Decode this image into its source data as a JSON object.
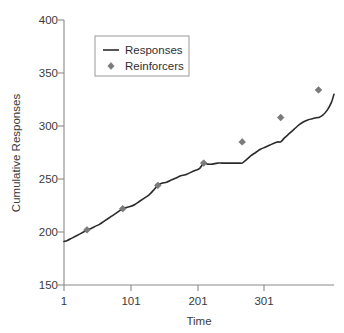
{
  "chart_data": {
    "type": "line",
    "title": "",
    "xlabel": "Time",
    "ylabel": "Cumulative Responses",
    "xlim": [
      1,
      401
    ],
    "ylim": [
      150,
      400
    ],
    "xticks": [
      "1",
      "101",
      "201",
      "301"
    ],
    "xtick_values": [
      1,
      101,
      201,
      301
    ],
    "yticks": [
      "150",
      "200",
      "250",
      "300",
      "350",
      "400"
    ],
    "ytick_values": [
      150,
      200,
      250,
      300,
      350,
      400
    ],
    "grid": false,
    "legend_position": "top-left-inside",
    "legend": [
      {
        "name": "Responses",
        "marker": "line",
        "color": "#2b2b2b"
      },
      {
        "name": "Reinforcers",
        "marker": "diamond",
        "color": "#7b7b7b"
      }
    ],
    "series": [
      {
        "name": "Responses",
        "type": "line",
        "x": [
          1,
          8,
          16,
          24,
          30,
          35,
          42,
          50,
          58,
          66,
          74,
          82,
          88,
          94,
          102,
          110,
          118,
          126,
          134,
          140,
          146,
          154,
          162,
          170,
          178,
          186,
          194,
          202,
          208,
          214,
          222,
          230,
          238,
          246,
          254,
          262,
          265,
          272,
          280,
          288,
          296,
          304,
          312,
          318,
          322,
          330,
          338,
          346,
          354,
          362,
          370,
          378,
          386,
          394,
          401
        ],
        "y": [
          191,
          192,
          194,
          197,
          199,
          202,
          204,
          206,
          209,
          212,
          215,
          219,
          222,
          223,
          225,
          228,
          231,
          233,
          234,
          236,
          239,
          244,
          247,
          249,
          251,
          253,
          255,
          257,
          258,
          261,
          264,
          265,
          265,
          265,
          265,
          265,
          265,
          268,
          272,
          276,
          279,
          281,
          283,
          284,
          285,
          290,
          295,
          300,
          303,
          305,
          306,
          307,
          308,
          308,
          308
        ]
      },
      {
        "name": "Reinforcers",
        "type": "scatter",
        "x": [
          35,
          88,
          140,
          208,
          265,
          322,
          378
        ],
        "y": [
          202,
          222,
          244,
          265,
          285,
          308,
          334
        ]
      }
    ],
    "line_detail_x": [
      1,
      6,
      12,
      18,
      24,
      30,
      35,
      40,
      46,
      53,
      60,
      67,
      74,
      81,
      88,
      93,
      99,
      106,
      113,
      120,
      127,
      133,
      140,
      146,
      153,
      160,
      167,
      174,
      181,
      188,
      195,
      202,
      208,
      214,
      221,
      228,
      235,
      242,
      249,
      256,
      262,
      265,
      271,
      278,
      285,
      292,
      299,
      306,
      313,
      318,
      322,
      328,
      335,
      342,
      349,
      356,
      363,
      370,
      376,
      378,
      384,
      391,
      397,
      401
    ],
    "line_detail_y": [
      191,
      192,
      194,
      196,
      198,
      200,
      202,
      203,
      205,
      207,
      210,
      213,
      216,
      219,
      222,
      223,
      224,
      226,
      229,
      232,
      235,
      239,
      244,
      246,
      247,
      249,
      251,
      253,
      254,
      256,
      258,
      260,
      265,
      264,
      264,
      265,
      265,
      265,
      265,
      265,
      265,
      265,
      268,
      272,
      275,
      278,
      280,
      282,
      284,
      285,
      285,
      289,
      293,
      297,
      301,
      304,
      306,
      307,
      308,
      308,
      310,
      315,
      322,
      330
    ]
  }
}
